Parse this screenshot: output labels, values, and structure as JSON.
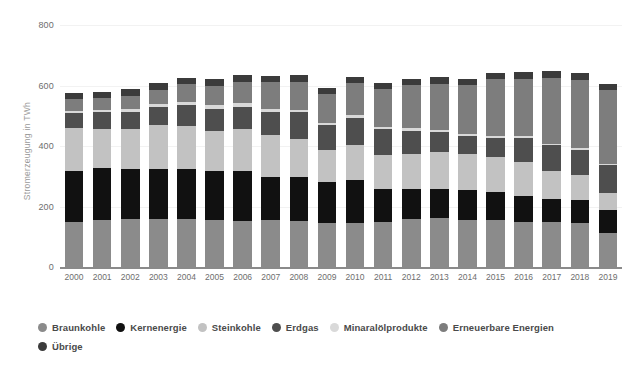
{
  "chart_data": {
    "type": "bar",
    "stacked": true,
    "title": "",
    "xlabel": "",
    "ylabel": "Stromerzeugung in TWh",
    "ylim": [
      0,
      800
    ],
    "yticks": [
      0,
      200,
      400,
      600,
      800
    ],
    "ytick_labels": [
      "0",
      "200",
      "400",
      "600",
      "800"
    ],
    "grid": true,
    "grid_axis": "y",
    "legend_position": "bottom-left",
    "categories": [
      "2000",
      "2001",
      "2002",
      "2003",
      "2004",
      "2005",
      "2006",
      "2007",
      "2008",
      "2009",
      "2010",
      "2011",
      "2012",
      "2013",
      "2014",
      "2015",
      "2016",
      "2017",
      "2018",
      "2019"
    ],
    "series": [
      {
        "name": "Braunkohle",
        "color": "#8b8b8b",
        "values": [
          148,
          155,
          158,
          158,
          158,
          154,
          151,
          155,
          151,
          146,
          146,
          150,
          160,
          161,
          156,
          155,
          150,
          148,
          146,
          114
        ]
      },
      {
        "name": "Kernenergie",
        "color": "#111111",
        "values": [
          170,
          171,
          165,
          165,
          167,
          163,
          167,
          141,
          148,
          135,
          141,
          108,
          99,
          97,
          97,
          92,
          85,
          76,
          76,
          75
        ]
      },
      {
        "name": "Steinkohle",
        "color": "#c2c2c2",
        "values": [
          143,
          130,
          134,
          146,
          141,
          134,
          137,
          142,
          124,
          107,
          117,
          112,
          116,
          121,
          119,
          117,
          112,
          92,
          83,
          57
        ]
      },
      {
        "name": "Erdgas",
        "color": "#4e4e4e",
        "values": [
          49,
          55,
          56,
          61,
          71,
          72,
          75,
          76,
          88,
          80,
          89,
          86,
          76,
          68,
          62,
          62,
          81,
          86,
          83,
          91
        ]
      },
      {
        "name": "Minaralölprodukte",
        "color": "#d9d9d9",
        "values": [
          6,
          7,
          8,
          9,
          10,
          12,
          11,
          9,
          9,
          9,
          9,
          7,
          7,
          7,
          6,
          6,
          6,
          6,
          5,
          5
        ]
      },
      {
        "name": "Erneuerbare Energien",
        "color": "#7d7d7d",
        "values": [
          38,
          40,
          45,
          46,
          57,
          63,
          72,
          88,
          93,
          95,
          105,
          124,
          143,
          152,
          162,
          188,
          189,
          217,
          225,
          243
        ]
      },
      {
        "name": "Übrige",
        "color": "#3b3b3b",
        "values": [
          20,
          21,
          21,
          22,
          22,
          22,
          22,
          22,
          22,
          21,
          21,
          21,
          21,
          21,
          21,
          22,
          22,
          22,
          22,
          21
        ]
      }
    ]
  },
  "axes": {
    "y_title": "Stromerzeugung in TWh",
    "y_tick_labels": [
      "800",
      "600",
      "400",
      "200",
      "0"
    ],
    "x_tick_labels": [
      "2000",
      "2001",
      "2002",
      "2003",
      "2004",
      "2005",
      "2006",
      "2007",
      "2008",
      "2009",
      "2010",
      "2011",
      "2012",
      "2013",
      "2014",
      "2015",
      "2016",
      "2017",
      "2018",
      "2019"
    ]
  },
  "legend": {
    "items": [
      {
        "label": "Braunkohle",
        "color": "#8b8b8b"
      },
      {
        "label": "Kernenergie",
        "color": "#111111"
      },
      {
        "label": "Steinkohle",
        "color": "#c2c2c2"
      },
      {
        "label": "Erdgas",
        "color": "#4e4e4e"
      },
      {
        "label": "Minaralölprodukte",
        "color": "#d9d9d9"
      },
      {
        "label": "Erneuerbare Energien",
        "color": "#7d7d7d"
      },
      {
        "label": "Übrige",
        "color": "#3b3b3b"
      }
    ]
  },
  "colors": {
    "background": "#ffffff",
    "gridline": "#f2f2f2",
    "axis": "#8a8a8a",
    "tick_text": "#6e6e6e",
    "legend_text": "#4a4a4a"
  }
}
